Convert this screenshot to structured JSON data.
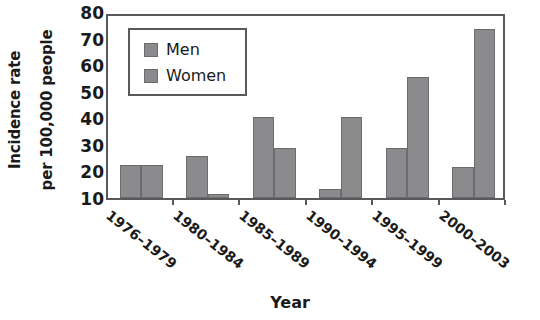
{
  "chart_data": {
    "type": "bar",
    "title": "",
    "xlabel": "Year",
    "ylabel": "Incidence rate per 100,000 people",
    "ylabel_line1": "Incidence rate",
    "ylabel_line2": "per 100,000 people",
    "categories": [
      "1976–1979",
      "1980–1984",
      "1985–1989",
      "1990–1994",
      "1995–1999",
      "2000–2003"
    ],
    "series": [
      {
        "name": "Men",
        "values": [
          22.5,
          26.0,
          40.5,
          13.5,
          29.0,
          21.5
        ]
      },
      {
        "name": "Women",
        "values": [
          22.5,
          11.5,
          29.0,
          40.5,
          55.5,
          73.5
        ]
      }
    ],
    "ylim": [
      10,
      80
    ],
    "yticks": [
      10,
      20,
      30,
      40,
      50,
      60,
      70,
      80
    ],
    "ytick_labels": [
      "10",
      "20",
      "30",
      "40",
      "50",
      "60",
      "70",
      "80"
    ],
    "grid": false,
    "legend_position": "upper-left",
    "bar_color": "#8b8b8d",
    "axis_color": "#59595c",
    "text_color": "#1a1a1a"
  },
  "legend": {
    "entries": [
      {
        "label": "Men"
      },
      {
        "label": "Women"
      }
    ]
  }
}
